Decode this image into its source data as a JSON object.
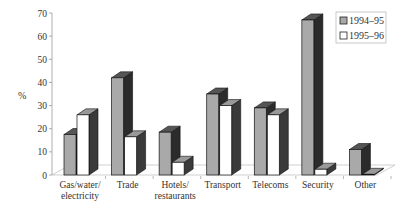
{
  "chart_data": {
    "type": "bar",
    "title": "",
    "xlabel": "",
    "ylabel": "%",
    "ylim": [
      0,
      70
    ],
    "yticks": [
      0,
      10,
      20,
      30,
      40,
      50,
      60,
      70
    ],
    "categories": [
      [
        "Gas/water/",
        "electricity"
      ],
      [
        "Trade"
      ],
      [
        "Hotels/",
        "restaurants"
      ],
      [
        "Transport"
      ],
      [
        "Telecoms"
      ],
      [
        "Security"
      ],
      [
        "Other"
      ]
    ],
    "series": [
      {
        "name": "1994–95",
        "values": [
          17.5,
          42,
          18.5,
          35,
          29,
          67,
          11
        ],
        "color": "#a9a9a9",
        "side_color": "#2b2b2b"
      },
      {
        "name": "1995–96",
        "values": [
          26,
          16.5,
          5.5,
          30,
          26,
          2.5,
          0.3
        ],
        "color": "#ffffff",
        "side_color": "#3a3a3a"
      }
    ],
    "legend": {
      "position": "top-right"
    },
    "grid": false,
    "style": "3d"
  }
}
